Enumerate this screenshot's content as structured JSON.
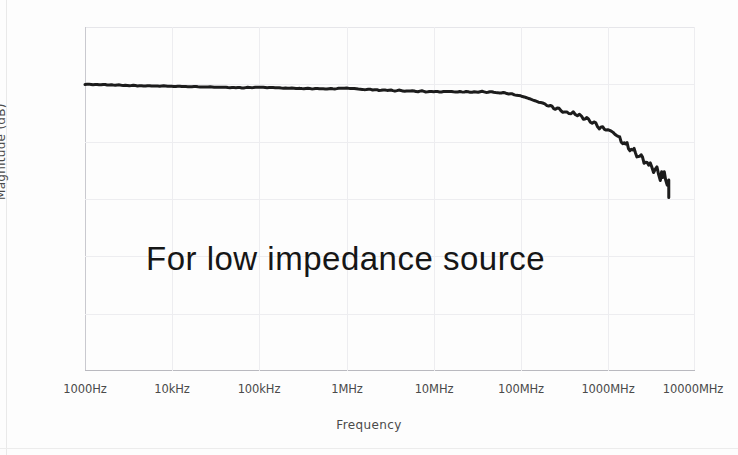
{
  "chart_data": {
    "type": "line",
    "title": "",
    "xlabel": "Frequency",
    "ylabel": "Magnitude (dB)",
    "xscale": "log",
    "grid": true,
    "legend": "none",
    "annotation": "For low impedance source",
    "xtick_labels": [
      "1000Hz",
      "10kHz",
      "100kHz",
      "1MHz",
      "10MHz",
      "100MHz",
      "1000MHz",
      "10000MHz"
    ],
    "xtick_values": [
      1000,
      10000,
      100000,
      1000000,
      10000000,
      100000000,
      1000000000,
      10000000000
    ],
    "ytick_labels": [
      "2",
      "0",
      "·2",
      "·4",
      "·6",
      "·8",
      "·10"
    ],
    "ytick_values": [
      2,
      0,
      -2,
      -4,
      -6,
      -8,
      -10
    ],
    "ylim": [
      -10,
      2
    ],
    "xlim": [
      1000,
      10000000000
    ],
    "series": [
      {
        "name": "Magnitude response",
        "color": "#1c1c1c",
        "x": [
          1000,
          2000,
          4000,
          8000,
          16000,
          32000,
          63000,
          100000,
          160000,
          250000,
          400000,
          630000,
          1000000,
          1600000,
          2500000,
          4000000,
          6300000,
          10000000,
          16000000,
          25000000,
          40000000,
          63000000,
          80000000,
          100000000,
          126000000,
          160000000,
          200000000,
          250000000,
          320000000,
          400000000,
          500000000,
          630000000,
          800000000,
          1000000000,
          1260000000,
          1600000000,
          2000000000,
          2500000000,
          3200000000,
          4000000000,
          4600000000,
          5000000000,
          5000000000
        ],
        "y": [
          0.0,
          -0.02,
          -0.05,
          -0.06,
          -0.08,
          -0.1,
          -0.12,
          -0.1,
          -0.12,
          -0.14,
          -0.15,
          -0.16,
          -0.13,
          -0.18,
          -0.2,
          -0.22,
          -0.24,
          -0.26,
          -0.25,
          -0.27,
          -0.26,
          -0.3,
          -0.35,
          -0.4,
          -0.5,
          -0.62,
          -0.72,
          -0.85,
          -0.95,
          -1.05,
          -1.1,
          -1.25,
          -1.45,
          -1.6,
          -1.8,
          -2.1,
          -2.35,
          -2.6,
          -2.9,
          -3.1,
          -3.3,
          -3.4,
          -3.95
        ]
      }
    ]
  },
  "axis": {
    "y_title": "Magnitude (dB)",
    "x_title": "Frequency"
  },
  "annotation": {
    "label": "For low impedance source"
  }
}
